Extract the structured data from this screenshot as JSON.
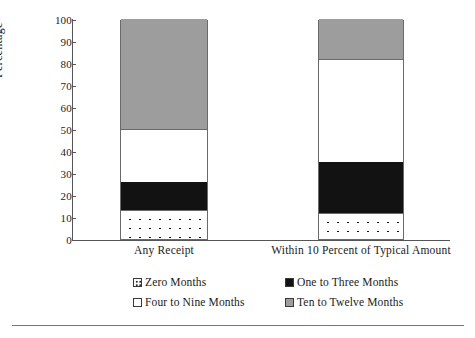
{
  "chart_data": {
    "type": "bar",
    "subtype": "stacked-vertical-100",
    "title": "",
    "xlabel": "",
    "ylabel": "Percentage",
    "ylim": [
      0,
      100
    ],
    "yticks": [
      0,
      10,
      20,
      30,
      40,
      50,
      60,
      70,
      80,
      90,
      100
    ],
    "grid": false,
    "legend_position": "bottom",
    "categories": [
      "Any Receipt",
      "Within 10 Percent of Typical Amount"
    ],
    "series": [
      {
        "name": "Zero Months",
        "fill": "dotted",
        "color": "#ffffff",
        "values": [
          13,
          12
        ]
      },
      {
        "name": "One to Three Months",
        "fill": "solid",
        "color": "#121212",
        "values": [
          13,
          23
        ]
      },
      {
        "name": "Four to Nine Months",
        "fill": "solid",
        "color": "#ffffff",
        "values": [
          24,
          47
        ]
      },
      {
        "name": "Ten to Twelve Months",
        "fill": "solid",
        "color": "#9d9d9d",
        "values": [
          50,
          18
        ]
      }
    ],
    "cumulative_tops": {
      "Any Receipt": {
        "Zero Months": 13,
        "One to Three Months": 26,
        "Four to Nine Months": 50,
        "Ten to Twelve Months": 100
      },
      "Within 10 Percent of Typical Amount": {
        "Zero Months": 12,
        "One to Three Months": 35,
        "Four to Nine Months": 82,
        "Ten to Twelve Months": 100
      }
    }
  },
  "axis": {
    "y_label": "Percentage",
    "y_ticks": [
      "100",
      "90",
      "80",
      "70",
      "60",
      "50",
      "40",
      "30",
      "20",
      "10",
      "0"
    ],
    "x_ticks": [
      "Any Receipt",
      "Within 10 Percent of Typical Amount"
    ]
  },
  "legend": {
    "items": [
      {
        "label": "Zero Months",
        "swatch": "dotted-swatch"
      },
      {
        "label": "One to Three Months",
        "swatch": "black-swatch"
      },
      {
        "label": "Four to Nine Months",
        "swatch": "white-swatch"
      },
      {
        "label": "Ten to Twelve Months",
        "swatch": "gray-swatch"
      }
    ]
  }
}
